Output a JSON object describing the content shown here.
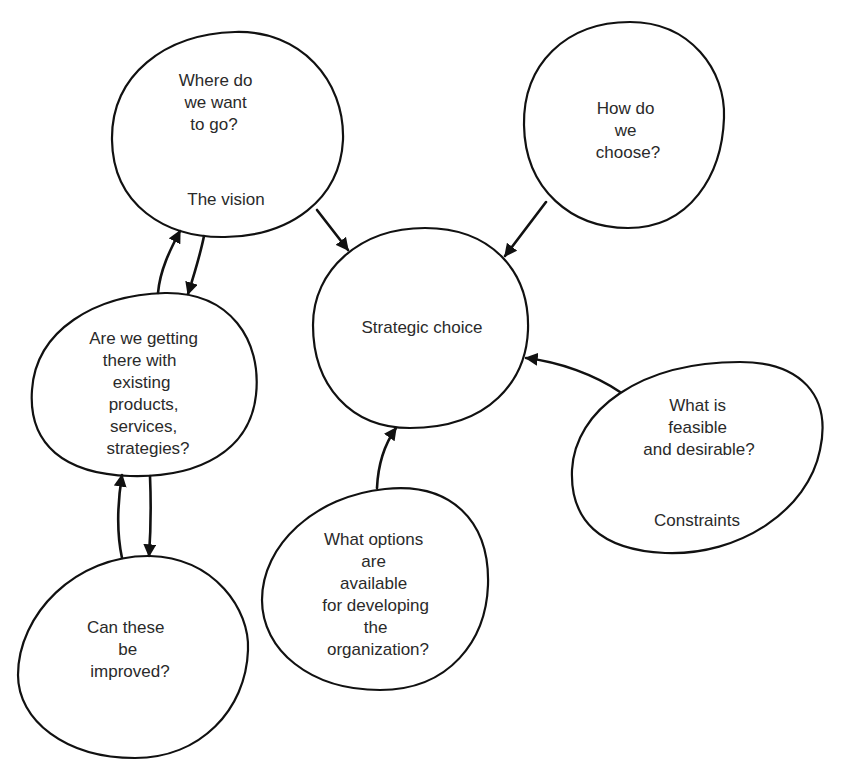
{
  "diagram": {
    "type": "concept-bubble-diagram",
    "colors": {
      "stroke": "#111111",
      "text": "#2a2a2a",
      "background": "#ffffff"
    },
    "nodes": {
      "vision": {
        "lines": [
          "Where do",
          "we want",
          "to go?"
        ],
        "caption": "The vision"
      },
      "choose": {
        "lines": [
          "How do",
          "we",
          "choose?"
        ]
      },
      "existing": {
        "lines": [
          "Are we getting",
          "there with",
          "existing",
          "products,",
          "services,",
          "strategies?"
        ]
      },
      "strategic_choice": {
        "lines": [
          "Strategic choice"
        ]
      },
      "feasible": {
        "lines": [
          "What is",
          "feasible",
          "and desirable?"
        ],
        "caption": "Constraints"
      },
      "options": {
        "lines": [
          "What options",
          "are",
          "available",
          "for developing",
          "the",
          "organization?"
        ]
      },
      "improve": {
        "lines": [
          "Can these",
          "be",
          "improved?"
        ]
      }
    },
    "edges": [
      {
        "from": "vision",
        "to": "strategic_choice"
      },
      {
        "from": "choose",
        "to": "strategic_choice"
      },
      {
        "from": "feasible",
        "to": "strategic_choice"
      },
      {
        "from": "options",
        "to": "strategic_choice"
      },
      {
        "from": "existing",
        "to": "vision"
      },
      {
        "from": "vision",
        "to": "existing"
      },
      {
        "from": "improve",
        "to": "existing"
      },
      {
        "from": "existing",
        "to": "improve"
      }
    ]
  }
}
